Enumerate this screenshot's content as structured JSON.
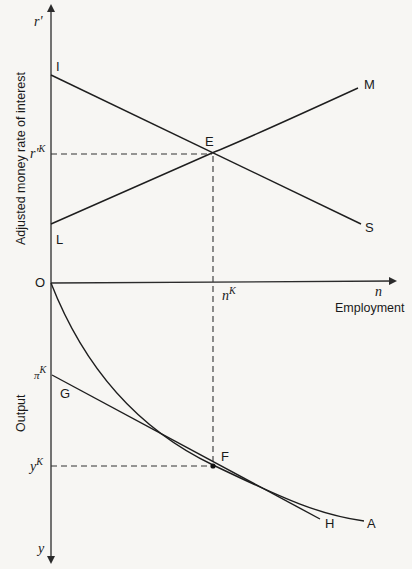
{
  "diagram": {
    "upper_axis": {
      "variable": "r'",
      "title": "Adjusted money rate of interest"
    },
    "lower_axis": {
      "variable": "y",
      "title": "Output"
    },
    "horizontal_axis": {
      "variable": "n",
      "title": "Employment"
    },
    "origin_label": "O",
    "equilibrium": {
      "upper_point": "E",
      "lower_point": "F",
      "r_label_base": "r'",
      "r_label_sup": "K",
      "n_label_base": "n",
      "n_label_sup": "K",
      "y_label_base": "y",
      "y_label_sup": "K",
      "pi_label_base": "π",
      "pi_label_sup": "K"
    },
    "curves": {
      "IS": {
        "start": "I",
        "end": "S"
      },
      "LM": {
        "start": "L",
        "end": "M"
      },
      "GH": {
        "start": "G",
        "end": "H"
      },
      "production": {
        "end": "A"
      }
    }
  }
}
